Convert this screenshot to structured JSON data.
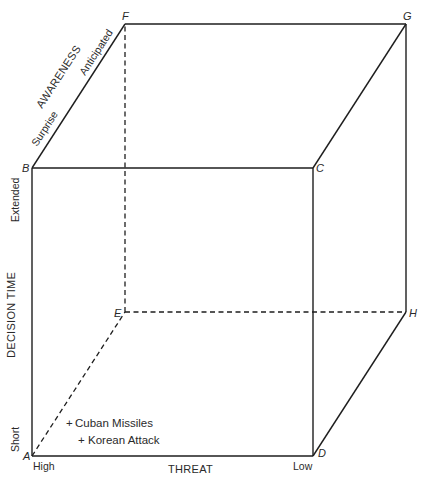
{
  "diagram": {
    "type": "3d-cube",
    "vertices": {
      "A": "A",
      "B": "B",
      "C": "C",
      "D": "D",
      "E": "E",
      "F": "F",
      "G": "G",
      "H": "H"
    },
    "axes": {
      "threat": {
        "label": "THREAT",
        "low_end": "High",
        "high_end": "Low"
      },
      "decision_time": {
        "label": "DECISION TIME",
        "low_end": "Short",
        "high_end": "Extended"
      },
      "awareness": {
        "label": "AWARENESS",
        "low_end": "Surprise",
        "high_end": "Anticipated"
      }
    },
    "events": [
      {
        "marker": "+",
        "label": "Cuban Missiles"
      },
      {
        "marker": "+",
        "label": "Korean Attack"
      }
    ]
  }
}
